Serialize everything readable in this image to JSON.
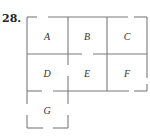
{
  "problem": {
    "number": "28."
  },
  "floor_plan": {
    "rooms": [
      {
        "id": "A",
        "label": "A",
        "x": 47,
        "y": 38
      },
      {
        "id": "B",
        "label": "B",
        "x": 87,
        "y": 38
      },
      {
        "id": "C",
        "label": "C",
        "x": 127,
        "y": 38
      },
      {
        "id": "D",
        "label": "D",
        "x": 47,
        "y": 75
      },
      {
        "id": "E",
        "label": "E",
        "x": 87,
        "y": 75
      },
      {
        "id": "F",
        "label": "F",
        "x": 127,
        "y": 75
      },
      {
        "id": "G",
        "label": "G",
        "x": 47,
        "y": 112
      }
    ],
    "wall_color": "#7a7a7a"
  }
}
